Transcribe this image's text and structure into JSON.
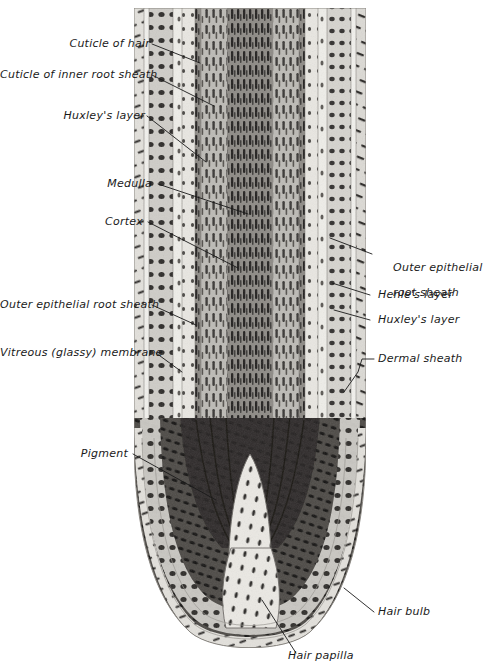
{
  "figure": {
    "ink_color": "#1a1a1a",
    "background_color": "#ffffff"
  },
  "labels": {
    "left": [
      {
        "id": "cuticle-of-hair",
        "text": "Cuticle of hair"
      },
      {
        "id": "cuticle-of-inner-root-sheath",
        "text": "Cuticle of inner root sheath"
      },
      {
        "id": "huxleys-layer-left",
        "text": "Huxley's layer"
      },
      {
        "id": "medulla",
        "text": "Medulla"
      },
      {
        "id": "cortex",
        "text": "Cortex"
      },
      {
        "id": "outer-epithelial-root-sheath-left",
        "text": "Outer epithelial root sheath"
      },
      {
        "id": "vitreous-glassy-membrane",
        "text": "Vitreous (glassy) membrane"
      },
      {
        "id": "pigment",
        "text": "Pigment"
      }
    ],
    "right": [
      {
        "id": "outer-epithelial-root-sheath-right",
        "line1": "Outer epithelial",
        "line2": "root sheath"
      },
      {
        "id": "henles-layer",
        "line1": "Henle's layer",
        "line2": ""
      },
      {
        "id": "huxleys-layer-right",
        "line1": "Huxley's layer",
        "line2": ""
      },
      {
        "id": "dermal-sheath",
        "line1": "Dermal sheath",
        "line2": ""
      },
      {
        "id": "hair-bulb",
        "line1": "Hair bulb",
        "line2": ""
      }
    ],
    "bottom": [
      {
        "id": "hair-papilla",
        "text": "Hair papilla"
      }
    ]
  }
}
